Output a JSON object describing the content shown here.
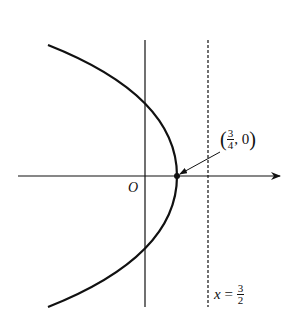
{
  "diagram": {
    "type": "parabola-graph",
    "equation_note": "left-opening parabola with vertex on positive x-axis",
    "origin_label": "O",
    "vertex_point": {
      "x_num": "3",
      "x_den": "4",
      "y": "0",
      "separator": ", ",
      "open": "(",
      "close": ")"
    },
    "directrix": {
      "var": "x",
      "eq": " = ",
      "num": "3",
      "den": "2"
    },
    "colors": {
      "stroke": "#111111",
      "background": "#ffffff"
    }
  }
}
